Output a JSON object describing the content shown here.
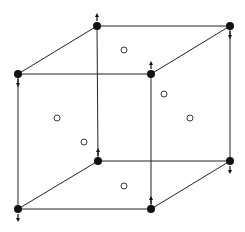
{
  "diagram": {
    "type": "crystal-lattice-cube",
    "colors": {
      "line": "#222222",
      "atom": "#111111",
      "open_site": "#ffffff",
      "background": "#ffffff"
    },
    "corners": [
      {
        "id": "top-back-left",
        "x": 97,
        "y": 26,
        "arrow": "up"
      },
      {
        "id": "top-back-right",
        "x": 230,
        "y": 26,
        "arrow": "down"
      },
      {
        "id": "top-front-left",
        "x": 18,
        "y": 74,
        "arrow": "down"
      },
      {
        "id": "top-front-right",
        "x": 151,
        "y": 74,
        "arrow": "up"
      },
      {
        "id": "bottom-back-left",
        "x": 98,
        "y": 161,
        "arrow": "up"
      },
      {
        "id": "bottom-back-right",
        "x": 230,
        "y": 161,
        "arrow": "down"
      },
      {
        "id": "bottom-front-left",
        "x": 18,
        "y": 209,
        "arrow": "down"
      },
      {
        "id": "bottom-front-right",
        "x": 151,
        "y": 209,
        "arrow": "up"
      }
    ],
    "edges": [
      [
        "top-back-left",
        "top-back-right"
      ],
      [
        "top-front-left",
        "top-front-right"
      ],
      [
        "top-back-left",
        "top-front-left"
      ],
      [
        "top-back-right",
        "top-front-right"
      ],
      [
        "bottom-back-left",
        "bottom-back-right"
      ],
      [
        "bottom-front-left",
        "bottom-front-right"
      ],
      [
        "bottom-back-left",
        "bottom-front-left"
      ],
      [
        "bottom-back-right",
        "bottom-front-right"
      ],
      [
        "top-back-left",
        "bottom-back-left"
      ],
      [
        "top-back-right",
        "bottom-back-right"
      ],
      [
        "top-front-left",
        "bottom-front-left"
      ],
      [
        "top-front-right",
        "bottom-front-right"
      ]
    ],
    "face_centers": [
      {
        "id": "top-face",
        "x": 124,
        "y": 50
      },
      {
        "id": "back-face",
        "x": 164,
        "y": 94
      },
      {
        "id": "left-face",
        "x": 57,
        "y": 118
      },
      {
        "id": "right-face",
        "x": 190,
        "y": 118
      },
      {
        "id": "front-face",
        "x": 84,
        "y": 142
      },
      {
        "id": "bottom-face",
        "x": 124,
        "y": 186
      }
    ]
  }
}
